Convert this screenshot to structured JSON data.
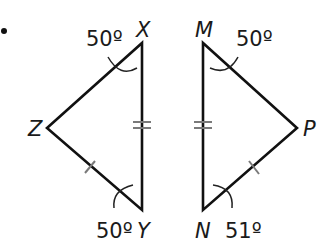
{
  "figure": {
    "bullet": "•",
    "triangle_left": {
      "vertices": {
        "X": {
          "label": "X",
          "x": 142,
          "y": 43
        },
        "Y": {
          "label": "Y",
          "x": 142,
          "y": 210
        },
        "Z": {
          "label": "Z",
          "x": 47,
          "y": 128
        }
      },
      "angles": {
        "X": "50º",
        "Y": "50º"
      },
      "congruence_marks": {
        "XY": "double-tick",
        "ZY": "single-tick"
      }
    },
    "triangle_right": {
      "vertices": {
        "M": {
          "label": "M",
          "x": 203,
          "y": 43
        },
        "N": {
          "label": "N",
          "x": 203,
          "y": 210
        },
        "P": {
          "label": "P",
          "x": 297,
          "y": 128
        }
      },
      "angles": {
        "M": "50º",
        "N": "51º"
      },
      "congruence_marks": {
        "MN": "double-tick",
        "NP": "single-tick"
      }
    },
    "colors": {
      "line": "#111111",
      "tick": "#7a7a7a",
      "text": "#1a1a1a",
      "background": "#ffffff"
    }
  }
}
